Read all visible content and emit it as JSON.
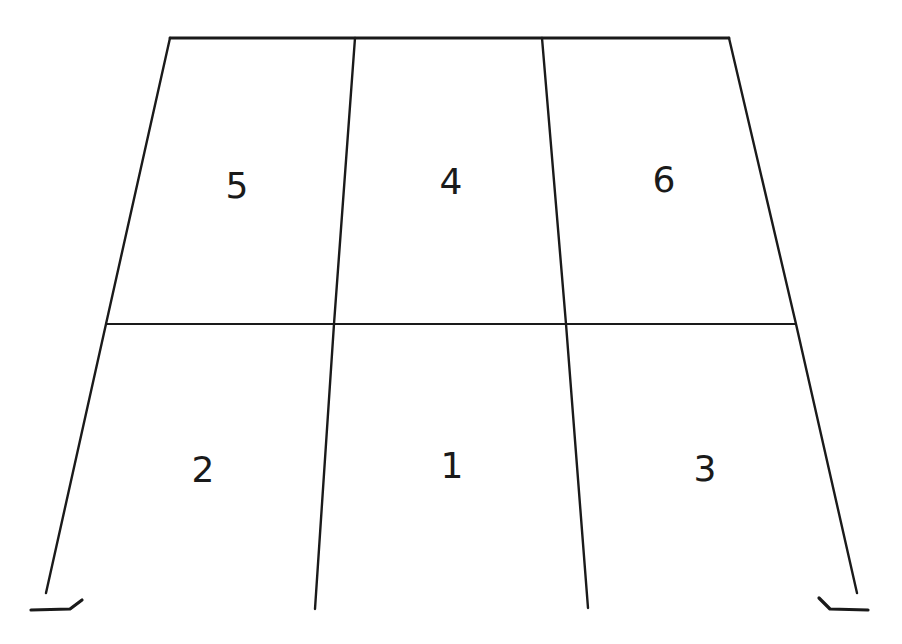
{
  "diagram": {
    "type": "two-story three-bay portal frame",
    "colors": {
      "background": "#ffffff",
      "line": "#1a1a1a"
    },
    "members": {
      "top_beam": {
        "x1": 170,
        "y1": 38,
        "x2": 729,
        "y2": 38
      },
      "middle_beam": {
        "x1": 106,
        "y1": 324,
        "x2": 796,
        "y2": 324
      },
      "columns": [
        {
          "id": "left-outer",
          "points": [
            [
              170,
              38
            ],
            [
              106,
              324
            ],
            [
              46,
              593
            ]
          ]
        },
        {
          "id": "interior-left",
          "points": [
            [
              355,
              38
            ],
            [
              334,
              324
            ],
            [
              315,
              609
            ]
          ]
        },
        {
          "id": "interior-right",
          "points": [
            [
              542,
              38
            ],
            [
              566,
              324
            ],
            [
              588,
              608
            ]
          ]
        },
        {
          "id": "right-outer",
          "points": [
            [
              729,
              38
            ],
            [
              796,
              324
            ],
            [
              857,
              593
            ]
          ]
        }
      ],
      "supports": [
        {
          "id": "left-support",
          "points": [
            [
              31,
              610
            ],
            [
              70,
              609
            ],
            [
              82,
              600
            ]
          ]
        },
        {
          "id": "right-support",
          "points": [
            [
              819,
              598
            ],
            [
              830,
              609
            ],
            [
              868,
              610
            ]
          ]
        }
      ]
    },
    "panels": [
      {
        "id": "panel-5",
        "label": "5",
        "x": 237,
        "y": 188
      },
      {
        "id": "panel-4",
        "label": "4",
        "x": 451,
        "y": 184
      },
      {
        "id": "panel-6",
        "label": "6",
        "x": 664,
        "y": 182
      },
      {
        "id": "panel-2",
        "label": "2",
        "x": 203,
        "y": 472
      },
      {
        "id": "panel-1",
        "label": "1",
        "x": 452,
        "y": 468
      },
      {
        "id": "panel-3",
        "label": "3",
        "x": 705,
        "y": 471
      }
    ]
  }
}
